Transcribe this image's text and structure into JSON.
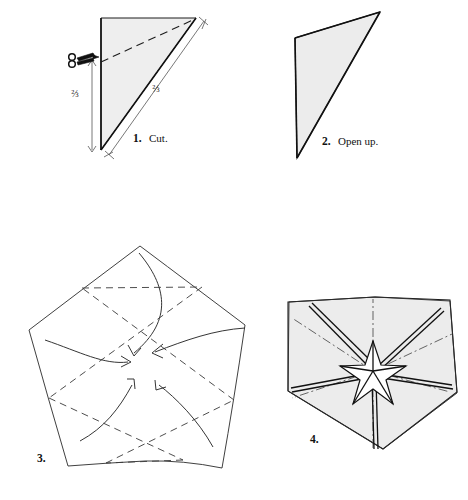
{
  "figure": {
    "background_color": "#ffffff",
    "paper_fill_color": "#eeeeee",
    "line_color": "#1c1c1c",
    "width": 468,
    "height": 500
  },
  "steps": [
    {
      "id": "step-1",
      "number": "1.",
      "label": "Cut.",
      "caption": "1.  Cut.",
      "shape": "right-triangle",
      "annotations": {
        "left_fraction": "⅔",
        "diagonal_fraction": "⅔",
        "tool_icon": "scissors-icon",
        "cut_line_style": "dashed"
      }
    },
    {
      "id": "step-2",
      "number": "2.",
      "label": "Open up.",
      "caption": "2.  Open up.",
      "shape": "triangle",
      "annotations": {}
    },
    {
      "id": "step-3",
      "number": "3.",
      "label": "",
      "caption": "3.",
      "shape": "pentagon",
      "annotations": {
        "fold_lines": "dashed pentagram",
        "arrow_count": "5",
        "arrow_direction": "inward to center"
      }
    },
    {
      "id": "step-4",
      "number": "4.",
      "label": "",
      "caption": "4.",
      "shape": "pentagon-with-star",
      "annotations": {
        "fold_lines": "dash-dot radial",
        "star_points": "5",
        "star_color": "#ffffff"
      }
    }
  ]
}
